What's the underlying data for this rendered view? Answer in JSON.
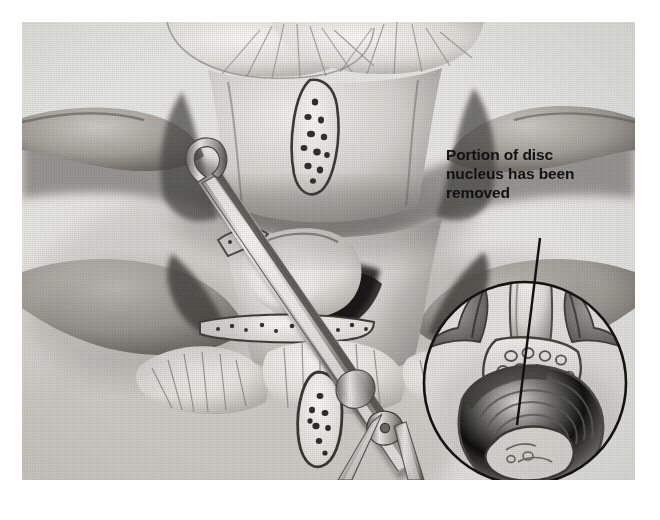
{
  "image": {
    "kind": "medical-illustration",
    "subject": "lumbar spine discectomy, posterior surgical view with rongeur instrument",
    "style": "halftone grayscale print",
    "background_color": "#e8e8e6",
    "ink_color": "#111111",
    "page_color": "#ffffff"
  },
  "caption": {
    "lines": [
      "Portion of disc",
      "nucleus has been",
      "removed"
    ],
    "full_text": "Portion of disc nucleus has been removed",
    "color": "#111111",
    "weight": "bold"
  },
  "leader_line": {
    "label": "leader line from caption to disc space in inset",
    "from_x": 540,
    "from_y": 238,
    "to_x": 517,
    "to_y": 425,
    "color": "#111111"
  },
  "inset": {
    "label": "circular cross-section inset of vertebra showing disc nucleus removed",
    "shape": "circle",
    "center_x": 525,
    "center_y": 383,
    "radius": 101,
    "stroke_color": "#111111"
  },
  "main_view": {
    "label": "posterior view of lumbar vertebrae with laminae, spinous processes and facet joints",
    "instrument": {
      "name": "pituitary-rongeur",
      "label": "surgical rongeur inserted into disc space"
    }
  }
}
